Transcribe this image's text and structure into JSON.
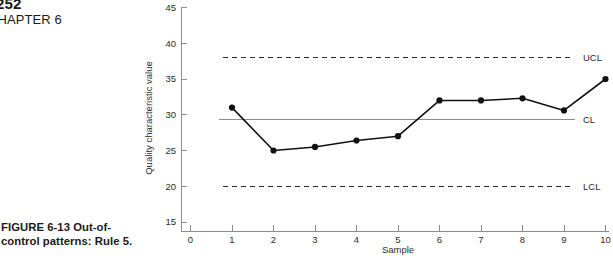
{
  "page": {
    "number": "252",
    "chapter": "CHAPTER 6",
    "caption_line1": "FIGURE 6-13  Out-of-",
    "caption_line2": "control patterns: Rule 5."
  },
  "chart_data": {
    "type": "line",
    "title": "",
    "xlabel": "Sample",
    "ylabel": "Quality characteristic value",
    "x": [
      1,
      2,
      3,
      4,
      5,
      6,
      7,
      8,
      9,
      10
    ],
    "values": [
      31.0,
      25.0,
      25.5,
      26.4,
      27.0,
      32.0,
      32.0,
      32.3,
      30.6,
      35.0
    ],
    "series": [
      {
        "name": "Quality characteristic value",
        "values": [
          31.0,
          25.0,
          25.5,
          26.4,
          27.0,
          32.0,
          32.0,
          32.3,
          30.6,
          35.0
        ]
      }
    ],
    "xlim": [
      0,
      10
    ],
    "ylim": [
      15,
      45
    ],
    "xticks": [
      "0",
      "1",
      "2",
      "3",
      "4",
      "5",
      "6",
      "7",
      "8",
      "9",
      "10"
    ],
    "yticks": [
      "15",
      "20",
      "25",
      "30",
      "35",
      "40",
      "45"
    ],
    "grid": false,
    "legend": "none",
    "control_limits": [
      {
        "key": "UCL",
        "label": "UCL",
        "value": 38.0,
        "style": "dashed"
      },
      {
        "key": "CL",
        "label": "CL",
        "value": 29.3,
        "style": "solid"
      },
      {
        "key": "LCL",
        "label": "LCL",
        "value": 20.0,
        "style": "dashed"
      }
    ],
    "colors": {
      "series": "#111111",
      "axis": "#8c8c8c",
      "limit_dashed": "#2b2b2b",
      "limit_solid": "#8c8c8c",
      "text": "#2b2b2b"
    }
  }
}
